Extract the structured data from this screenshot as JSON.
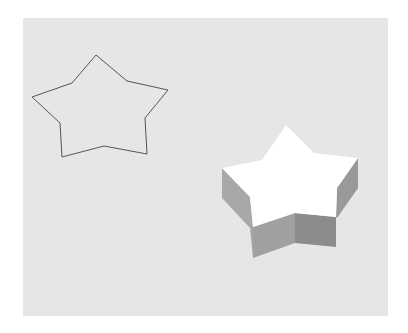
{
  "figure": {
    "background_color": "#e6e6e6",
    "outline_star": {
      "stroke": "#555555",
      "points": "96,55 127,81 168,90 145,118 147,154 104,146 62,157 60,123 32,97 72,83"
    },
    "extruded_star": {
      "top_face_color": "#ffffff",
      "top_face": "286,125 314,153 358,158 337,188 336,217 295,213 253,227 250,197 222,168 262,160",
      "side_left_color": "#a8a8a8",
      "side_left": "222,168 250,197 253,227 253,258 250,228 222,198",
      "side_front_left_color": "#a0a0a0",
      "side_front_left": "253,227 295,213 295,243 253,258",
      "side_front_right_color": "#8c8c8c",
      "side_front_right": "295,213 336,217 336,247 295,243",
      "side_right_color": "#999999",
      "side_right": "336,217 337,188 358,158 358,188 337,218"
    }
  }
}
